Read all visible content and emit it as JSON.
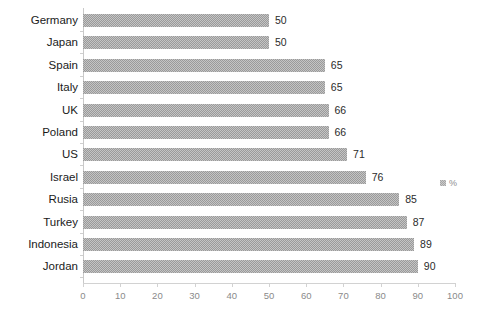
{
  "chart_data": {
    "type": "bar",
    "orientation": "horizontal",
    "title": "",
    "xlabel": "",
    "ylabel": "",
    "categories": [
      "Germany",
      "Japan",
      "Spain",
      "Italy",
      "UK",
      "Poland",
      "US",
      "Israel",
      "Rusia",
      "Turkey",
      "Indonesia",
      "Jordan"
    ],
    "values": [
      50,
      50,
      65,
      65,
      66,
      66,
      71,
      76,
      85,
      87,
      89,
      90
    ],
    "series": [
      {
        "name": "%",
        "values": [
          50,
          50,
          65,
          65,
          66,
          66,
          71,
          76,
          85,
          87,
          89,
          90
        ]
      }
    ],
    "xlim": [
      0,
      100
    ],
    "xticks": [
      0,
      10,
      20,
      30,
      40,
      50,
      60,
      70,
      80,
      90,
      100
    ],
    "xtick_labels": [
      "0",
      "10",
      "20",
      "30",
      "40",
      "50",
      "60",
      "70",
      "80",
      "90",
      "100"
    ],
    "data_labels": [
      "50",
      "50",
      "65",
      "65",
      "66",
      "66",
      "71",
      "76",
      "85",
      "87",
      "89",
      "90"
    ],
    "grid": false,
    "legend": {
      "entries": [
        "%"
      ],
      "position": "right"
    },
    "colors": {
      "bar": "#9a9a9a",
      "background": "#ffffff",
      "axis": "#d2d2d2",
      "tick_label": "#8a8a8a",
      "category_label": "#1a1a1a",
      "value_label": "#2b2b2b"
    }
  }
}
